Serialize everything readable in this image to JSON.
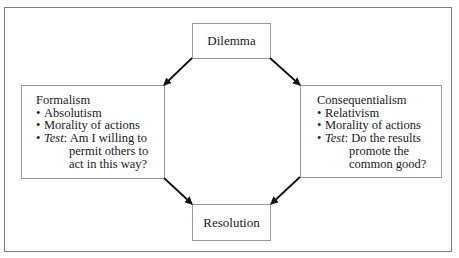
{
  "diagram": {
    "type": "flow",
    "nodes": {
      "dilemma": {
        "label": "Dilemma"
      },
      "resolution": {
        "label": "Resolution"
      },
      "formalism": {
        "title": "Formalism",
        "bullets": [
          {
            "text": "Absolutism"
          },
          {
            "text": "Morality of actions"
          }
        ],
        "test": {
          "label": "Test",
          "separator": ":",
          "lines": [
            "Am I willing to",
            "permit others to",
            "act in this way?"
          ]
        }
      },
      "consequentialism": {
        "title": "Consequentialism",
        "bullets": [
          {
            "text": "Relativism"
          },
          {
            "text": "Morality of actions"
          }
        ],
        "test": {
          "label": "Test",
          "separator": ":",
          "lines": [
            "Do the results",
            "promote the",
            "common good?"
          ]
        }
      }
    },
    "edges": [
      {
        "from": "Dilemma",
        "to": "Formalism"
      },
      {
        "from": "Dilemma",
        "to": "Consequentialism"
      },
      {
        "from": "Formalism",
        "to": "Resolution"
      },
      {
        "from": "Consequentialism",
        "to": "Resolution"
      }
    ],
    "bullet_glyph": "•",
    "colors": {
      "frame": "#7a7a7a",
      "box_border": "#9a9a9a",
      "arrow": "#111111",
      "text": "#1a1a1a"
    }
  }
}
